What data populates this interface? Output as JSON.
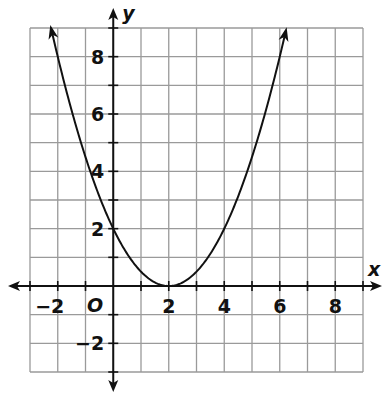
{
  "chart_data": {
    "type": "line",
    "title": "",
    "xlabel": "x",
    "ylabel": "y",
    "origin_label": "O",
    "xlim": [
      -3,
      9
    ],
    "ylim": [
      -3,
      9
    ],
    "grid": true,
    "grid_step": 1,
    "x_ticks": [
      -2,
      2,
      4,
      6,
      8
    ],
    "x_tick_labels": [
      "−2",
      "2",
      "4",
      "6",
      "8"
    ],
    "y_ticks": [
      -2,
      2,
      4,
      6,
      8
    ],
    "y_tick_labels": [
      "−2",
      "2",
      "4",
      "6",
      "8"
    ],
    "series": [
      {
        "name": "parabola",
        "equation": "y = 0.5(x - 2)^2",
        "vertex": [
          2,
          0
        ],
        "y_intercept": [
          0,
          2
        ],
        "x": [
          -2.25,
          -2,
          -1,
          0,
          1,
          2,
          3,
          4,
          5,
          6,
          6.2
        ],
        "y": [
          9.03,
          8,
          4.5,
          2,
          0.5,
          0,
          0.5,
          2,
          4.5,
          8,
          8.82
        ],
        "arrows_both_ends": true
      }
    ]
  }
}
